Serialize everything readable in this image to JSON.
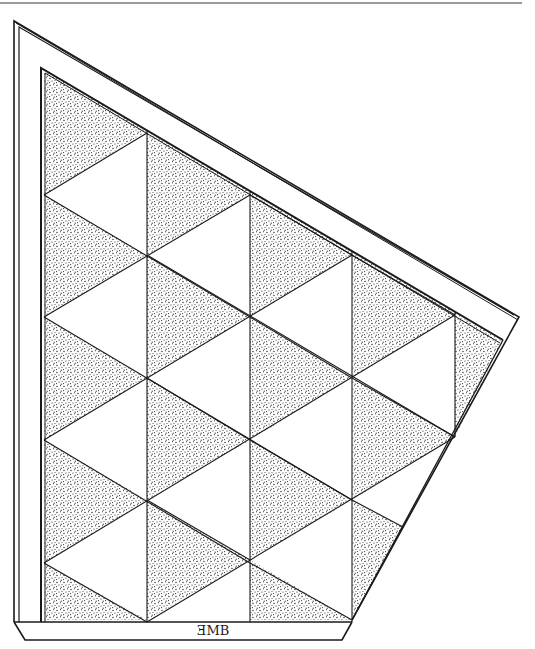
{
  "artwork": {
    "title": "Triangular grid stippled quilt-like panel drawing",
    "background": "#ffffff",
    "ink_color": "#1a1a1a",
    "top_rule_color": "#9a9a9a",
    "signature": "ƎMB"
  },
  "frame": {
    "outer": [
      [
        14,
        21
      ],
      [
        519,
        317
      ],
      [
        352,
        620
      ],
      [
        14,
        622
      ]
    ],
    "inner": [
      [
        41,
        68
      ],
      [
        503,
        340
      ],
      [
        352,
        620
      ],
      [
        41,
        622
      ]
    ],
    "base": [
      [
        14,
        622
      ],
      [
        352,
        622
      ],
      [
        342,
        640
      ],
      [
        25,
        640
      ]
    ]
  },
  "grid": {
    "columns_x": [
      44,
      147,
      250,
      352,
      455
    ],
    "even_column_vertices_y": [
      195,
      317,
      440,
      563
    ],
    "odd_column_vertices_y": [
      133,
      255,
      378,
      500
    ]
  },
  "stippled_regions": [
    [
      [
        44,
        70
      ],
      [
        147,
        131
      ],
      [
        44,
        195
      ]
    ],
    [
      [
        44,
        195
      ],
      [
        147,
        255
      ],
      [
        44,
        317
      ]
    ],
    [
      [
        44,
        317
      ],
      [
        147,
        378
      ],
      [
        44,
        440
      ]
    ],
    [
      [
        44,
        440
      ],
      [
        147,
        500
      ],
      [
        44,
        563
      ]
    ],
    [
      [
        44,
        563
      ],
      [
        147,
        620
      ],
      [
        44,
        620
      ]
    ],
    [
      [
        147,
        131
      ],
      [
        250,
        191
      ],
      [
        250,
        195
      ],
      [
        147,
        255
      ]
    ],
    [
      [
        147,
        255
      ],
      [
        250,
        317
      ],
      [
        147,
        378
      ]
    ],
    [
      [
        147,
        378
      ],
      [
        250,
        440
      ],
      [
        147,
        500
      ]
    ],
    [
      [
        147,
        500
      ],
      [
        250,
        560
      ],
      [
        147,
        620
      ]
    ],
    [
      [
        250,
        191
      ],
      [
        352,
        251
      ],
      [
        352,
        255
      ],
      [
        250,
        317
      ]
    ],
    [
      [
        250,
        317
      ],
      [
        352,
        378
      ],
      [
        250,
        440
      ]
    ],
    [
      [
        250,
        440
      ],
      [
        352,
        500
      ],
      [
        250,
        560
      ]
    ],
    [
      [
        250,
        560
      ],
      [
        352,
        620
      ],
      [
        250,
        620
      ]
    ],
    [
      [
        352,
        251
      ],
      [
        455,
        312
      ],
      [
        455,
        315
      ],
      [
        352,
        378
      ]
    ],
    [
      [
        352,
        378
      ],
      [
        455,
        437
      ],
      [
        352,
        500
      ]
    ],
    [
      [
        352,
        500
      ],
      [
        403,
        527
      ],
      [
        352,
        620
      ]
    ],
    [
      [
        455,
        312
      ],
      [
        503,
        340
      ],
      [
        455,
        437
      ]
    ]
  ]
}
